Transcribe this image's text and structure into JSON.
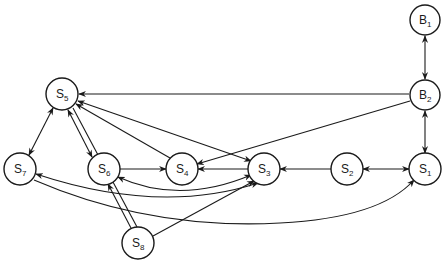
{
  "diagram": {
    "type": "directed-graph",
    "nodes": [
      {
        "id": "B1",
        "letter": "B",
        "sub": "1",
        "x": 425,
        "y": 20
      },
      {
        "id": "B2",
        "letter": "B",
        "sub": "2",
        "x": 425,
        "y": 95
      },
      {
        "id": "S5",
        "letter": "S",
        "sub": "5",
        "x": 62,
        "y": 94
      },
      {
        "id": "S7",
        "letter": "S",
        "sub": "7",
        "x": 20,
        "y": 169
      },
      {
        "id": "S6",
        "letter": "S",
        "sub": "6",
        "x": 104,
        "y": 169
      },
      {
        "id": "S4",
        "letter": "S",
        "sub": "4",
        "x": 182,
        "y": 169
      },
      {
        "id": "S3",
        "letter": "S",
        "sub": "3",
        "x": 264,
        "y": 169
      },
      {
        "id": "S2",
        "letter": "S",
        "sub": "2",
        "x": 347,
        "y": 169
      },
      {
        "id": "S1",
        "letter": "S",
        "sub": "1",
        "x": 425,
        "y": 169
      },
      {
        "id": "S8",
        "letter": "S",
        "sub": "8",
        "x": 138,
        "y": 243
      }
    ],
    "edges": [
      {
        "from": "B1",
        "to": "B2",
        "bidirectional": true
      },
      {
        "from": "B2",
        "to": "S5",
        "bidirectional": false
      },
      {
        "from": "B2",
        "to": "S4",
        "bidirectional": false
      },
      {
        "from": "B2",
        "to": "S1",
        "bidirectional": true
      },
      {
        "from": "S5",
        "to": "S7",
        "bidirectional": true
      },
      {
        "from": "S5",
        "to": "S6",
        "bidirectional": true,
        "style": "double"
      },
      {
        "from": "S4",
        "to": "S5",
        "bidirectional": false
      },
      {
        "from": "S5",
        "to": "S3",
        "bidirectional": true
      },
      {
        "from": "S6",
        "to": "S4",
        "bidirectional": false
      },
      {
        "from": "S3",
        "to": "S4",
        "bidirectional": false
      },
      {
        "from": "S2",
        "to": "S3",
        "bidirectional": false
      },
      {
        "from": "S2",
        "to": "S1",
        "bidirectional": true
      },
      {
        "from": "S6",
        "to": "S3",
        "bidirectional": true,
        "style": "curve"
      },
      {
        "from": "S7",
        "to": "S3",
        "bidirectional": true,
        "style": "curve"
      },
      {
        "from": "S7",
        "to": "S1",
        "bidirectional": false,
        "style": "curve"
      },
      {
        "from": "S8",
        "to": "S6",
        "bidirectional": false,
        "style": "double"
      },
      {
        "from": "S8",
        "to": "S3",
        "bidirectional": false
      }
    ]
  }
}
